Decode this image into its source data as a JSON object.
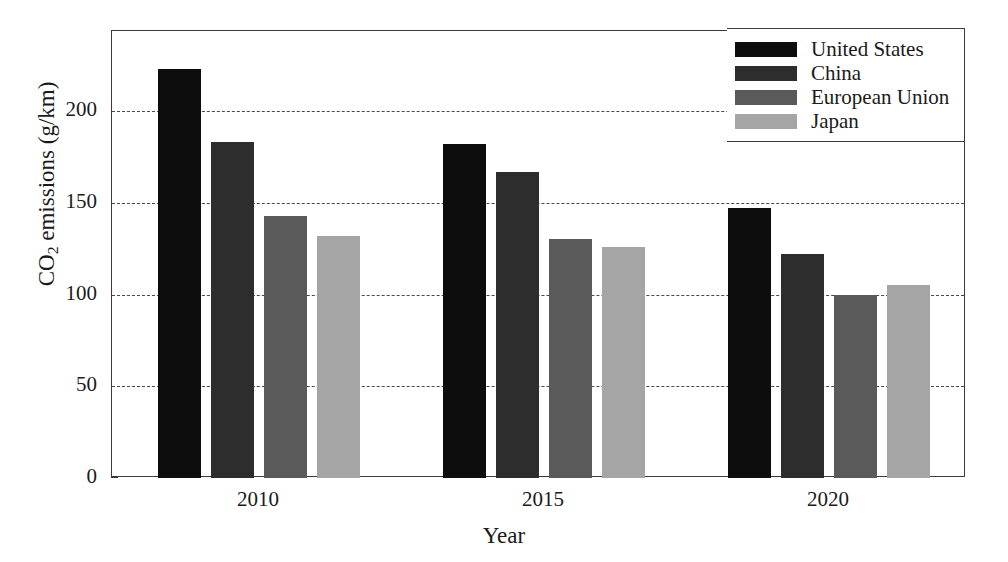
{
  "chart_data": {
    "type": "bar",
    "title": "",
    "xlabel": "Year",
    "ylabel": "CO2 emissions (g/km)",
    "ylabel_parts": {
      "prefix": "CO",
      "sub": "2",
      "suffix": " emissions (g/km)"
    },
    "categories": [
      "2010",
      "2015",
      "2020"
    ],
    "series": [
      {
        "name": "United States",
        "color": "#0d0d0d",
        "values": [
          223,
          182,
          147
        ]
      },
      {
        "name": "China",
        "color": "#2d2d2d",
        "values": [
          183,
          167,
          122
        ]
      },
      {
        "name": "European Union",
        "color": "#5a5a5a",
        "values": [
          143,
          130,
          100
        ]
      },
      {
        "name": "Japan",
        "color": "#a5a5a5",
        "values": [
          132,
          126,
          105
        ]
      }
    ],
    "ylim": [
      0,
      243.6
    ],
    "yticks": [
      0,
      50,
      100,
      150,
      200
    ],
    "ytick_labels": [
      "0",
      "50",
      "100",
      "150",
      "200"
    ],
    "gridlines": [
      50,
      100,
      150,
      200
    ],
    "grid": true,
    "grid_style": "dashed",
    "legend_position": "top-right",
    "legend_entries": [
      "United States",
      "China",
      "European Union",
      "Japan"
    ],
    "axis_color": "#3a3a3a",
    "background": "#ffffff"
  }
}
